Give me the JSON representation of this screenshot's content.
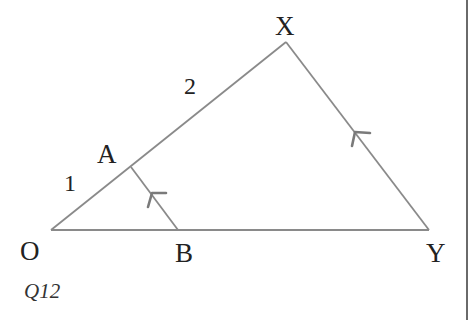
{
  "figure": {
    "question_label": "Q12",
    "vertices": {
      "O": {
        "label": "O",
        "x": 51,
        "y": 230
      },
      "A": {
        "label": "A",
        "x": 131,
        "y": 167
      },
      "B": {
        "label": "B",
        "x": 178,
        "y": 230
      },
      "X": {
        "label": "X",
        "x": 286,
        "y": 42
      },
      "Y": {
        "label": "Y",
        "x": 429,
        "y": 230
      }
    },
    "segment_labels": {
      "OA": "1",
      "AX": "2"
    },
    "parallel_marks": [
      "AB",
      "XY"
    ],
    "colors": {
      "line": "#8a8a8a",
      "arrow": "#7a7a7a",
      "text": "#222222",
      "border": "#6a6a6a"
    }
  }
}
